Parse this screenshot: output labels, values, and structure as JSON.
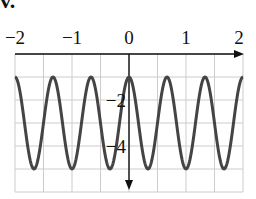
{
  "figure": {
    "label": "v."
  },
  "chart_data": {
    "type": "line",
    "title": "",
    "function": "y = 2cos(3πx) − 3",
    "xlabel": "",
    "ylabel": "",
    "xlim": [
      -2,
      2
    ],
    "ylim": [
      -6,
      0
    ],
    "grid": true,
    "x_ticks": [
      -2,
      -1,
      0,
      1,
      2
    ],
    "x_tick_labels": [
      "−2",
      "−1",
      "0",
      "1",
      "2"
    ],
    "y_ticks": [
      -2,
      -4
    ],
    "y_tick_labels": [
      "−2",
      "−4"
    ],
    "series": [
      {
        "name": "curve",
        "amplitude": 2,
        "midline": -3,
        "period": 0.6667,
        "max": -1,
        "min": -5,
        "peaks_x": [
          -2,
          -1.333,
          -0.667,
          0,
          0.667,
          1.333,
          2
        ],
        "troughs_x": [
          -1.667,
          -1,
          -0.333,
          0.333,
          1,
          1.667
        ]
      }
    ],
    "colors": {
      "curve": "#444444",
      "grid": "#cccccc",
      "axis": "#111111"
    }
  }
}
